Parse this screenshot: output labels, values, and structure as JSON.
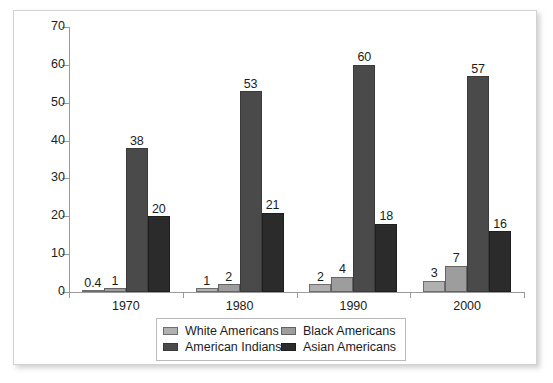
{
  "chart_data": {
    "type": "bar",
    "title": "",
    "subtitle": "",
    "xlabel": "",
    "ylabel": "",
    "categories": [
      "1970",
      "1980",
      "1990",
      "2000"
    ],
    "series": [
      {
        "name": "White Americans",
        "color": "#b0b0b0",
        "values": [
          0.4,
          1,
          2,
          3
        ]
      },
      {
        "name": "Black Americans",
        "color": "#9d9d9d",
        "values": [
          1,
          2,
          4,
          7
        ]
      },
      {
        "name": "American Indians",
        "color": "#4a4a4a",
        "values": [
          38,
          53,
          60,
          57
        ]
      },
      {
        "name": "Asian Americans",
        "color": "#2b2b2b",
        "values": [
          20,
          21,
          18,
          16
        ]
      }
    ],
    "value_labels": [
      [
        "0.4",
        "1",
        "38",
        "20"
      ],
      [
        "1",
        "2",
        "53",
        "21"
      ],
      [
        "2",
        "4",
        "60",
        "18"
      ],
      [
        "3",
        "7",
        "57",
        "16"
      ]
    ],
    "ylim": [
      0,
      70
    ],
    "yticks": [
      0,
      10,
      20,
      30,
      40,
      50,
      60,
      70
    ],
    "ytick_labels": [
      "0",
      "10",
      "20",
      "30",
      "40",
      "50",
      "60",
      "70"
    ],
    "grid": false,
    "legend_position": "bottom",
    "data_labels": true,
    "axis_color": "#9a9a9a",
    "text_color": "#1c1c1c",
    "background": "#ffffff"
  },
  "legend": {
    "rows": [
      {
        "left": "White Americans",
        "right": "Black Americans"
      },
      {
        "left": "American Indians",
        "right": "Asian Americans"
      }
    ]
  }
}
